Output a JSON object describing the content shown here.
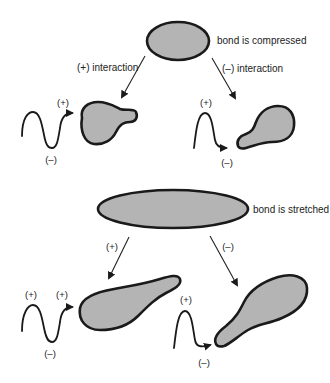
{
  "diagram": {
    "type": "bond deformation and interaction diagram",
    "top_section": {
      "state_label": "bond is compressed",
      "branches": [
        {
          "arrow_label": "(+) interaction",
          "wave_peak_label": "(+)",
          "wave_trough_label": "(–)"
        },
        {
          "arrow_label": "(–) interaction",
          "wave_peak_label": "(+)",
          "wave_trough_label": "(–)"
        }
      ]
    },
    "bottom_section": {
      "state_label": "bond is stretched",
      "branches": [
        {
          "arrow_label": "(+)",
          "wave_peak_label_left": "(+)",
          "wave_peak_label_right": "(+)",
          "wave_trough_label": "(–)"
        },
        {
          "arrow_label": "(–)",
          "wave_peak_label": "(+)",
          "wave_trough_label": "(–)"
        }
      ]
    },
    "colors": {
      "fill": "#b4b4b4",
      "stroke": "#1a1a1a",
      "background": "#ffffff"
    }
  }
}
